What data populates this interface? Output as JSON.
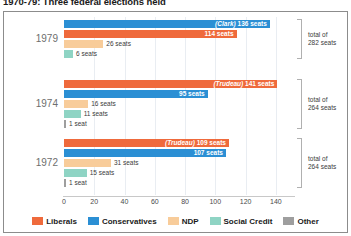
{
  "title": "1970-79: Three federal elections held",
  "colors": {
    "liberals": "#ef6a3c",
    "conservatives": "#2b8fd4",
    "ndp": "#f8cc9a",
    "social_credit": "#8fd4c4",
    "other": "#9e9e9e",
    "gridline": "#e9edf2",
    "axis": "#c8c8c8",
    "bracket": "#b0b0b0",
    "panel_border": "#8c8c8c",
    "year_text": "#6e6e6e"
  },
  "chart_data": {
    "type": "bar",
    "orientation": "horizontal",
    "title": "1970-79: Three federal elections held",
    "xlabel": "",
    "ylabel": "",
    "xlim": [
      0,
      152
    ],
    "grid": true,
    "legend_position": "bottom",
    "xticks": [
      0,
      20,
      40,
      60,
      80,
      100,
      120,
      140
    ],
    "categories": [
      "1979",
      "1974",
      "1972"
    ],
    "legend": [
      {
        "name": "Liberals",
        "color": "#ef6a3c"
      },
      {
        "name": "Conservatives",
        "color": "#2b8fd4"
      },
      {
        "name": "NDP",
        "color": "#f8cc9a"
      },
      {
        "name": "Social Credit",
        "color": "#8fd4c4"
      },
      {
        "name": "Other",
        "color": "#9e9e9e"
      }
    ],
    "groups": [
      {
        "year": "1979",
        "total_line1": "total of",
        "total_line2": "282 seats",
        "total_seats": 282,
        "bars": [
          {
            "party": "Conservatives",
            "value": 136,
            "label": "(Clark) 136 seats",
            "leader": "(Clark)",
            "label_inside": true
          },
          {
            "party": "Liberals",
            "value": 114,
            "label": "114 seats",
            "leader": "",
            "label_inside": true
          },
          {
            "party": "NDP",
            "value": 26,
            "label": "26 seats",
            "leader": "",
            "label_inside": false
          },
          {
            "party": "Social Credit",
            "value": 6,
            "label": "6 seats",
            "leader": "",
            "label_inside": false
          }
        ]
      },
      {
        "year": "1974",
        "total_line1": "total of",
        "total_line2": "264 seats",
        "total_seats": 264,
        "bars": [
          {
            "party": "Liberals",
            "value": 141,
            "label": "(Trudeau) 141 seats",
            "leader": "(Trudeau)",
            "label_inside": true
          },
          {
            "party": "Conservatives",
            "value": 95,
            "label": "95 seats",
            "leader": "",
            "label_inside": true
          },
          {
            "party": "NDP",
            "value": 16,
            "label": "16 seats",
            "leader": "",
            "label_inside": false
          },
          {
            "party": "Social Credit",
            "value": 11,
            "label": "11 seats",
            "leader": "",
            "label_inside": false
          },
          {
            "party": "Other",
            "value": 1,
            "label": "1 seat",
            "leader": "",
            "label_inside": false
          }
        ]
      },
      {
        "year": "1972",
        "total_line1": "total of",
        "total_line2": "264 seats",
        "total_seats": 264,
        "bars": [
          {
            "party": "Liberals",
            "value": 109,
            "label": "(Trudeau) 109 seats",
            "leader": "(Trudeau)",
            "label_inside": true
          },
          {
            "party": "Conservatives",
            "value": 107,
            "label": "107 seats",
            "leader": "",
            "label_inside": true
          },
          {
            "party": "NDP",
            "value": 31,
            "label": "31 seats",
            "leader": "",
            "label_inside": false
          },
          {
            "party": "Social Credit",
            "value": 15,
            "label": "15 seats",
            "leader": "",
            "label_inside": false
          },
          {
            "party": "Other",
            "value": 1,
            "label": "1 seat",
            "leader": "",
            "label_inside": false
          }
        ]
      }
    ]
  }
}
